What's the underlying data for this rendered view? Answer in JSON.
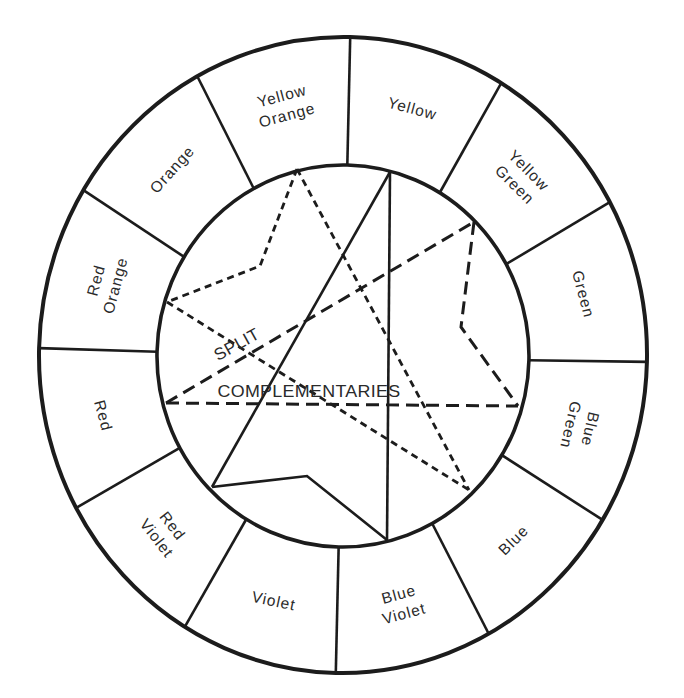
{
  "diagram": {
    "segments": [
      {
        "lines": [
          "Yellow"
        ],
        "rotation": 15
      },
      {
        "lines": [
          "Yellow",
          "Green"
        ],
        "rotation": 45
      },
      {
        "lines": [
          "Green"
        ],
        "rotation": 75
      },
      {
        "lines": [
          "Blue",
          "Green"
        ],
        "rotation": 103
      },
      {
        "lines": [
          "Blue"
        ],
        "rotation": -45
      },
      {
        "lines": [
          "Blue",
          "Violet"
        ],
        "rotation": -15
      },
      {
        "lines": [
          "Violet"
        ],
        "rotation": 12
      },
      {
        "lines": [
          "Red",
          "Violet"
        ],
        "rotation": 52
      },
      {
        "lines": [
          "Red"
        ],
        "rotation": 75
      },
      {
        "lines": [
          "Red",
          "Orange"
        ],
        "rotation": -75
      },
      {
        "lines": [
          "Orange"
        ],
        "rotation": -48
      },
      {
        "lines": [
          "Yellow",
          "Orange"
        ],
        "rotation": -15
      }
    ],
    "inner_labels": {
      "split": "SPLIT",
      "complementaries": "COMPLEMENTARIES"
    },
    "colors": {
      "stroke": "#1c1c1c",
      "text": "#2a2a2a",
      "background": "#ffffff"
    }
  }
}
